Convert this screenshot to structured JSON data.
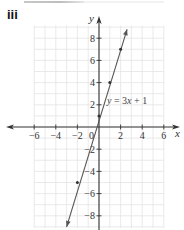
{
  "question": {
    "part_label": "iii"
  },
  "chart_data": {
    "type": "line",
    "title": "",
    "xlabel": "x",
    "ylabel": "y",
    "xlim": [
      -6,
      6
    ],
    "ylim": [
      -9,
      9
    ],
    "grid": true,
    "x_ticks": [
      -6,
      -4,
      -2,
      0,
      2,
      4,
      6
    ],
    "y_ticks": [
      -8,
      -6,
      -4,
      -2,
      2,
      4,
      6,
      8
    ],
    "x_tick_labels": [
      "−6",
      "−4",
      "−2",
      "0",
      "2",
      "4",
      "6"
    ],
    "y_tick_labels": [
      "−8",
      "−6",
      "−4",
      "−2",
      "2",
      "4",
      "6",
      "8"
    ],
    "origin_label": "0",
    "series": [
      {
        "name": "y = 3x + 1",
        "equation": "y = 3x + 1",
        "slope": 3,
        "intercept": 1,
        "plotted_points": [
          {
            "x": -2,
            "y": -5
          },
          {
            "x": 0,
            "y": 1
          },
          {
            "x": 1,
            "y": 4
          },
          {
            "x": 2,
            "y": 7
          }
        ],
        "line_extent": {
          "x_start": -3.0,
          "y_start": -9.0,
          "x_end": 2.6,
          "y_end": 8.8
        },
        "arrows_both_ends": true
      }
    ],
    "annotations": [
      {
        "text": "y = 3x + 1",
        "near": {
          "x": 1,
          "y": 2
        }
      }
    ],
    "colors": {
      "axis": "#333333",
      "grid": "#e4e4e4",
      "line": "#555555",
      "points": "#333333"
    }
  }
}
